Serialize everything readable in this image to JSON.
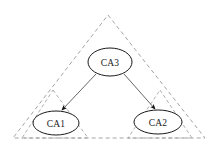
{
  "diagram": {
    "type": "node-link-diagram",
    "canvas": {
      "width": 217,
      "height": 150,
      "background": "#ffffff"
    },
    "colors": {
      "node_stroke": "#1a1a1a",
      "node_fill": "#ffffff",
      "node_text": "#1a1a1a",
      "outer_boundary_stroke": "#9a9a9a",
      "inner_boundary_stroke": "#9a9a9a",
      "edge_stroke": "#555555",
      "arrow_fill": "#111111"
    },
    "boundaries": [
      {
        "name": "outer-trust-domain",
        "shape": "triangle",
        "style": "dashed",
        "stroke": "#9a9a9a",
        "stroke_width": 0.9,
        "dash": "4 3",
        "points": "108,15 205,138 13,138"
      },
      {
        "name": "left-trust-domain",
        "shape": "triangle",
        "style": "dashed",
        "stroke": "#9a9a9a",
        "stroke_width": 0.8,
        "dash": "3.5 2.5",
        "points": "53,90 88,138 22,138"
      },
      {
        "name": "right-trust-domain",
        "shape": "triangle",
        "style": "dashed",
        "stroke": "#9a9a9a",
        "stroke_width": 0.8,
        "dash": "3.5 2.5",
        "points": "160,90 192,138 128,138"
      }
    ],
    "nodes": [
      {
        "id": "ca3",
        "label": "CA3",
        "shape": "ellipse",
        "cx": 110,
        "cy": 62,
        "rx": 22,
        "ry": 14
      },
      {
        "id": "ca1",
        "label": "CA1",
        "shape": "ellipse",
        "cx": 56,
        "cy": 123,
        "rx": 23,
        "ry": 12
      },
      {
        "id": "ca2",
        "label": "CA2",
        "shape": "ellipse",
        "cx": 158,
        "cy": 122,
        "rx": 24,
        "ry": 12
      }
    ],
    "edges": [
      {
        "name": "ca3-to-ca1",
        "from": "ca3",
        "to": "ca1",
        "directed": true,
        "path": "M 96,74 L 62,110",
        "arrow_at": "ca1"
      },
      {
        "name": "ca3-to-ca2",
        "from": "ca3",
        "to": "ca2",
        "directed": true,
        "path": "M 124,74 L 155,109",
        "arrow_at": "ca2"
      }
    ]
  }
}
